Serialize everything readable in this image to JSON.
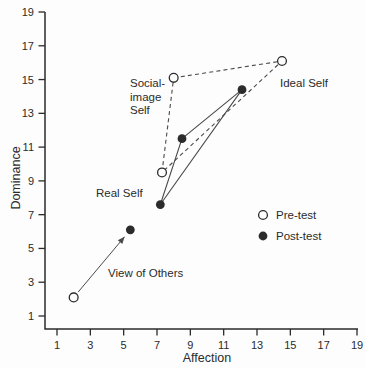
{
  "figure": {
    "background": "#fdfdfd",
    "ink": "#2b2b2b",
    "line_color": "#4a4a4a"
  },
  "chart_data": {
    "type": "scatter",
    "title": "",
    "xlabel": "Affection",
    "ylabel": "Dominance",
    "xlim": [
      1,
      19
    ],
    "ylim": [
      1,
      19
    ],
    "xticks": [
      "1",
      "3",
      "5",
      "7",
      "9",
      "11",
      "13",
      "15",
      "17",
      "19"
    ],
    "yticks": [
      "1",
      "3",
      "5",
      "7",
      "9",
      "11",
      "13",
      "15",
      "17",
      "19"
    ],
    "grid": false,
    "series": [
      {
        "name": "Pre-test",
        "marker": "open-circle",
        "line_style": "dashed",
        "points": [
          {
            "id": "social-image-self",
            "x": 8.0,
            "y": 15.1
          },
          {
            "id": "ideal-self",
            "x": 14.5,
            "y": 16.1
          },
          {
            "id": "real-self",
            "x": 7.3,
            "y": 9.5
          },
          {
            "id": "view-of-others",
            "x": 2.0,
            "y": 2.1
          }
        ],
        "polygon": [
          "social-image-self",
          "ideal-self",
          "real-self"
        ]
      },
      {
        "name": "Post-test",
        "marker": "filled-circle",
        "line_style": "solid",
        "points": [
          {
            "id": "social-image-self",
            "x": 8.5,
            "y": 11.5
          },
          {
            "id": "ideal-self",
            "x": 12.1,
            "y": 14.4
          },
          {
            "id": "real-self",
            "x": 7.2,
            "y": 7.6
          },
          {
            "id": "view-of-others",
            "x": 5.4,
            "y": 6.1
          }
        ],
        "polygon": [
          "social-image-self",
          "ideal-self",
          "real-self"
        ]
      }
    ],
    "arrow": {
      "point_id": "view-of-others",
      "from_series": "Pre-test",
      "to_series": "Post-test"
    },
    "annotations": [
      {
        "id": "social-image-self-label",
        "lines": [
          "Social-",
          "image",
          "Self"
        ],
        "px": 130,
        "py": 83
      },
      {
        "id": "ideal-self-label",
        "lines": [
          "Ideal Self"
        ],
        "px": 280,
        "py": 83
      },
      {
        "id": "real-self-label",
        "lines": [
          "Real Self"
        ],
        "px": 96,
        "py": 193
      },
      {
        "id": "view-of-others-label",
        "lines": [
          "View of Others"
        ],
        "px": 108,
        "py": 273
      }
    ],
    "legend": {
      "position": "inside-right",
      "px": 263,
      "py": 215,
      "row_gap": 21,
      "entries": [
        {
          "label": "Pre-test",
          "marker": "open-circle"
        },
        {
          "label": "Post-test",
          "marker": "filled-circle"
        }
      ]
    }
  }
}
